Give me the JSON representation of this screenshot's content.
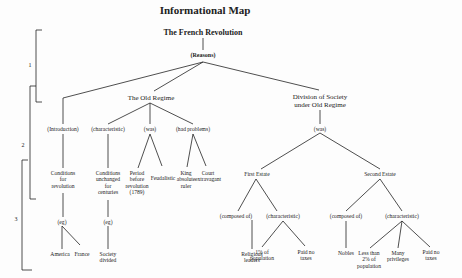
{
  "title": "Informational Map",
  "root": "The French Revolution",
  "link_root": "(Reasons)",
  "levels": [
    "1",
    "2",
    "3"
  ],
  "branches": {
    "introduction": {
      "link": "(Introduction)",
      "node": "Conditions\nfor\nrevolution",
      "sub_link": "(eg)",
      "examples": [
        "America",
        "France"
      ]
    },
    "old_regime": {
      "label": "The Old Regime",
      "characteristic": {
        "link": "(characteristic)",
        "node": "Conditions\nunchanged\nfor\ncenturies",
        "sub_link": "(eg)",
        "example": "Society\ndivided"
      },
      "was": {
        "link": "(was)",
        "nodes": [
          "Period\nbefore\nrevolution\n(1789)",
          "Feudalistic"
        ]
      },
      "had_problems": {
        "link": "(had problems)",
        "nodes": [
          "King\nabsolute\nruler",
          "Court\nextravagant"
        ]
      }
    },
    "division": {
      "label": "Division of Society\nunder Old Regime",
      "link": "(was)",
      "first_estate": {
        "label": "First Estate",
        "composed_link": "(composed of)",
        "composed": "Religious\nleaders",
        "char_link": "(characteristic)",
        "characteristics": [
          "1% of\npopulation",
          "Paid no\ntaxes"
        ]
      },
      "second_estate": {
        "label": "Second Estate",
        "composed_link": "(composed of)",
        "composed": "Nobles",
        "char_link": "(characteristic)",
        "characteristics": [
          "Less than\n2% of\npopulation",
          "Many\nprivileges",
          "Paid no\ntaxes"
        ]
      }
    }
  },
  "colors": {
    "line": "#222222",
    "background": "#fdfdfd",
    "text": "#222222"
  }
}
